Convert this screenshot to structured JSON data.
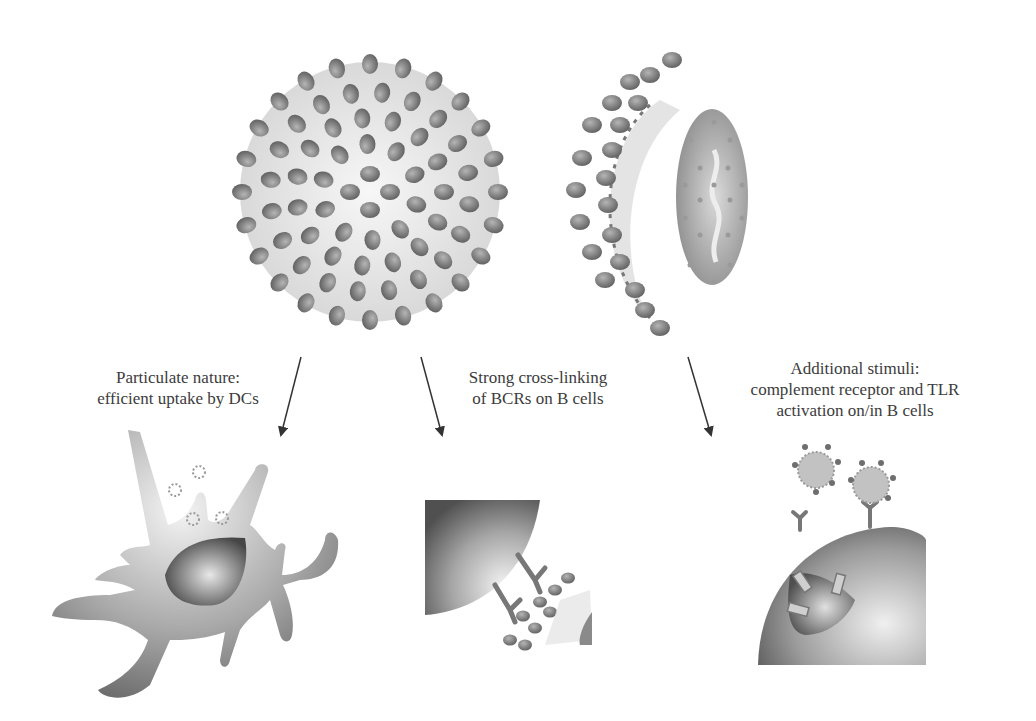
{
  "figure": {
    "top_illustrations": [
      {
        "name": "vlp-whole",
        "description": "Spherical virus-like particle covered with surface spikes"
      },
      {
        "name": "vlp-cross-section",
        "description": "Cut-away VLP showing shell and internal nucleic acid"
      }
    ],
    "labels": [
      {
        "lines": [
          "Particulate nature:",
          "efficient uptake by DCs"
        ]
      },
      {
        "lines": [
          "Strong cross-linking",
          "of BCRs on B cells"
        ]
      },
      {
        "lines": [
          "Additional stimuli:",
          "complement receptor and TLR",
          "activation on/in B cells"
        ]
      }
    ],
    "bottom_illustrations": [
      {
        "name": "dendritic-cell",
        "description": "Dendritic cell taking up particles"
      },
      {
        "name": "b-cell-crosslinking",
        "description": "B cell receptors cross-linked by VLP"
      },
      {
        "name": "b-cell-stimulation",
        "description": "B cell with receptors binding particles and TLR activation"
      }
    ],
    "colors": {
      "background": "#ffffff",
      "spike": "#7a7a7a",
      "text": "#3c3c3c",
      "arrow": "#333333"
    }
  }
}
